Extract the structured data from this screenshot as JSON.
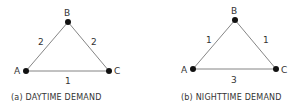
{
  "diagrams": [
    {
      "caption": "(a) DAYTIME DEMAND",
      "nodes": {
        "A": "A",
        "B": "B",
        "C": "C"
      },
      "edges": {
        "AB": "2",
        "BC": "2",
        "AC": "1"
      }
    },
    {
      "caption": "(b) NIGHTTIME DEMAND",
      "nodes": {
        "A": "A",
        "B": "B",
        "C": "C"
      },
      "edges": {
        "AB": "1",
        "BC": "1",
        "AC": "3"
      }
    }
  ],
  "colors": {
    "line": "#555555",
    "node": "#111111",
    "text": "#333333"
  }
}
